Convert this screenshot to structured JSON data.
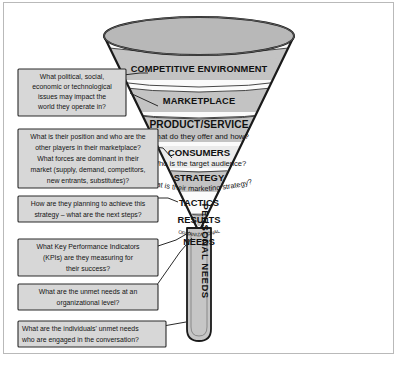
{
  "diagram": {
    "colors": {
      "band_gray": "#c3c3c3",
      "band_light": "#ebebeb",
      "band_white": "#fbfbfb",
      "cap_gray": "#b8b8b8",
      "outline": "#1a1a1a",
      "callout_fill": "#d7d7d7",
      "callout_border": "#2a2a2a",
      "leader_line": "#2a2a2a",
      "page_bg": "#ffffff"
    }
  },
  "funnel": {
    "tiers": [
      {
        "id": "competitive-environment",
        "label": "COMPETITIVE ENVIRONMENT",
        "sublabel": "",
        "shade": "gray"
      },
      {
        "id": "marketplace",
        "label": "MARKETPLACE",
        "sublabel": "",
        "shade": "gray"
      },
      {
        "id": "product-service",
        "label": "PRODUCT/SERVICE",
        "sublabel": "What do they offer and how?",
        "shade": "gray"
      },
      {
        "id": "consumers",
        "label": "CONSUMERS",
        "sublabel": "Who is the target audience?",
        "shade": "light"
      },
      {
        "id": "strategy",
        "label": "STRATEGY",
        "sublabel": "What is their marketing strategy?",
        "shade": "gray"
      },
      {
        "id": "tactics",
        "label": "TACTICS",
        "sublabel": "",
        "shade": "white"
      },
      {
        "id": "results",
        "label": "RESULTS",
        "sublabel": "",
        "shade": "gray"
      },
      {
        "id": "organizational-needs",
        "label": "NEEDS",
        "sublabel": "ORGANIZATIONAL",
        "shade": "white"
      }
    ],
    "neck": {
      "id": "personal-needs",
      "label": "PERSONAL NEEDS",
      "orientation": "vertical"
    }
  },
  "callouts": [
    {
      "id": "callout-competitive-environment",
      "target": "competitive-environment",
      "align": "center",
      "lines": [
        "What political, social,",
        "economic or technological",
        "issues may impact the",
        "world they operate in?"
      ]
    },
    {
      "id": "callout-marketplace",
      "target": "marketplace",
      "align": "center",
      "lines": [
        "What is their position and who are the",
        "other players in their marketplace?",
        "What forces are dominant in their",
        "market (supply, demand, competitors,",
        "new entrants, substitutes)?"
      ]
    },
    {
      "id": "callout-tactics",
      "target": "tactics",
      "align": "center",
      "lines": [
        "How are they planning to achieve this",
        "strategy – what are the next steps?"
      ]
    },
    {
      "id": "callout-results",
      "target": "results",
      "align": "center",
      "lines": [
        "What Key Performance Indicators",
        "(KPIs) are they measuring for",
        "their success?"
      ]
    },
    {
      "id": "callout-organizational-needs",
      "target": "organizational-needs",
      "align": "center",
      "lines": [
        "What are the unmet needs at an",
        "organizational level?"
      ]
    },
    {
      "id": "callout-personal-needs",
      "target": "personal-needs",
      "align": "left",
      "lines": [
        "What are the individuals' unmet needs",
        "who are engaged in the conversation?"
      ]
    }
  ]
}
